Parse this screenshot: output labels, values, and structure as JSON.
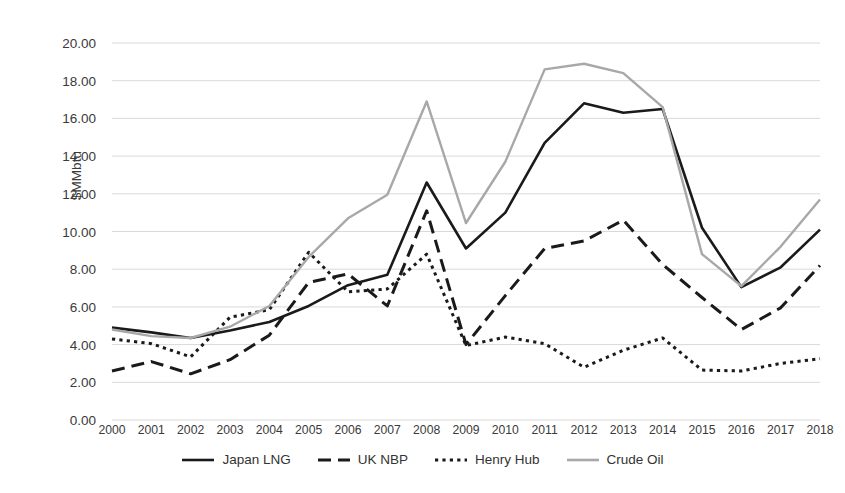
{
  "chart_data": {
    "type": "line",
    "title": "",
    "xlabel": "",
    "ylabel": "$MMbtu",
    "ylim": [
      0,
      20
    ],
    "ytick_step": 2,
    "grid": true,
    "legend_position": "bottom",
    "categories": [
      "2000",
      "2001",
      "2002",
      "2003",
      "2004",
      "2005",
      "2006",
      "2007",
      "2008",
      "2009",
      "2010",
      "2011",
      "2012",
      "2013",
      "2014",
      "2015",
      "2016",
      "2017",
      "2018"
    ],
    "ytick_labels": [
      "0.00",
      "2.00",
      "4.00",
      "6.00",
      "8.00",
      "10.00",
      "12.00",
      "14.00",
      "16.00",
      "18.00",
      "20.00"
    ],
    "series": [
      {
        "name": "Japan LNG",
        "style": "solid",
        "color": "#1a1a1a",
        "values": [
          4.9,
          4.65,
          4.35,
          4.75,
          5.2,
          6.05,
          7.15,
          7.7,
          12.6,
          9.1,
          11.0,
          14.7,
          16.8,
          16.3,
          16.5,
          10.2,
          7.05,
          8.1,
          10.1
        ]
      },
      {
        "name": "UK NBP",
        "style": "dashed",
        "color": "#1a1a1a",
        "values": [
          2.6,
          3.1,
          2.45,
          3.2,
          4.5,
          7.3,
          7.75,
          6.05,
          11.1,
          4.0,
          6.6,
          9.1,
          9.5,
          10.6,
          8.25,
          6.5,
          4.8,
          5.95,
          8.2
        ]
      },
      {
        "name": "Henry Hub",
        "style": "dotted",
        "color": "#1a1a1a",
        "values": [
          4.3,
          4.05,
          3.35,
          5.45,
          5.85,
          8.9,
          6.8,
          6.95,
          8.8,
          3.95,
          4.4,
          4.05,
          2.8,
          3.7,
          4.35,
          2.65,
          2.6,
          3.0,
          3.25
        ]
      },
      {
        "name": "Crude Oil",
        "style": "solid",
        "color": "#a8a8a8",
        "values": [
          4.8,
          4.45,
          4.35,
          4.95,
          6.05,
          8.65,
          10.7,
          11.95,
          16.9,
          10.45,
          13.7,
          18.6,
          18.9,
          18.4,
          16.6,
          8.8,
          7.1,
          9.2,
          11.7
        ]
      }
    ]
  },
  "legend": {
    "items": [
      {
        "label": "Japan LNG",
        "swatch": "solid-black-line-icon"
      },
      {
        "label": "UK NBP",
        "swatch": "dashed-black-line-icon"
      },
      {
        "label": "Henry Hub",
        "swatch": "dotted-black-line-icon"
      },
      {
        "label": "Crude Oil",
        "swatch": "solid-gray-line-icon"
      }
    ]
  },
  "colors": {
    "grid": "#d9d9d9",
    "text": "#3a3a3a",
    "japan_lng": "#1a1a1a",
    "uk_nbp": "#1a1a1a",
    "henry_hub": "#1a1a1a",
    "crude_oil": "#a8a8a8",
    "background": "#ffffff"
  }
}
